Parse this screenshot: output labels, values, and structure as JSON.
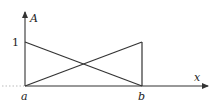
{
  "diagram": {
    "type": "membership-function-plot",
    "axes": {
      "y_label": "A",
      "x_label": "x",
      "y_tick_label": "1",
      "x_tick_labels": [
        "a",
        "b"
      ]
    },
    "lines": [
      {
        "name": "decreasing-line",
        "from": [
          "a",
          1
        ],
        "to": [
          "b",
          0
        ]
      },
      {
        "name": "increasing-line",
        "from": [
          "a",
          0
        ],
        "to": [
          "b",
          1
        ]
      },
      {
        "name": "vertical-line-at-b",
        "from": [
          "b",
          0
        ],
        "to": [
          "b",
          1
        ]
      }
    ],
    "colors": {
      "stroke": "#333333",
      "background": "#ffffff"
    }
  }
}
